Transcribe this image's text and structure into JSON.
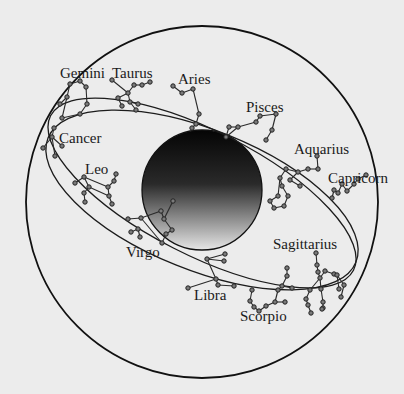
{
  "diagram": {
    "background": "#ececec",
    "outer_circle": {
      "cx": 202,
      "cy": 202,
      "r": 176
    },
    "sun": {
      "cx": 202,
      "cy": 190,
      "r": 60,
      "gradient": [
        "#050505",
        "#2a2a2a",
        "#e6e6e6"
      ]
    },
    "orbits": [
      {
        "cx": 202,
        "cy": 193,
        "rx": 170,
        "ry": 62,
        "rotate": 27
      },
      {
        "cx": 202,
        "cy": 200,
        "rx": 166,
        "ry": 70,
        "rotate": 22
      }
    ],
    "labels": [
      {
        "name": "Gemini",
        "x": 60,
        "y": 78
      },
      {
        "name": "Taurus",
        "x": 112,
        "y": 78
      },
      {
        "name": "Aries",
        "x": 178,
        "y": 84
      },
      {
        "name": "Pisces",
        "x": 246,
        "y": 112
      },
      {
        "name": "Aquarius",
        "x": 294,
        "y": 154
      },
      {
        "name": "Capricorn",
        "x": 328,
        "y": 183
      },
      {
        "name": "Cancer",
        "x": 59,
        "y": 143
      },
      {
        "name": "Leo",
        "x": 85,
        "y": 174
      },
      {
        "name": "Virgo",
        "x": 126,
        "y": 257
      },
      {
        "name": "Sagittarius",
        "x": 273,
        "y": 249
      },
      {
        "name": "Libra",
        "x": 194,
        "y": 300
      },
      {
        "name": "Scorpio",
        "x": 240,
        "y": 321
      }
    ],
    "constellations": [
      {
        "name": "Gemini",
        "stars": [
          [
            80,
            81
          ],
          [
            70,
            84
          ],
          [
            86,
            87
          ],
          [
            67,
            97
          ],
          [
            87,
            104
          ],
          [
            62,
            118
          ],
          [
            80,
            114
          ],
          [
            60,
            104
          ]
        ],
        "lines": [
          [
            0,
            1
          ],
          [
            0,
            2
          ],
          [
            1,
            3
          ],
          [
            3,
            5
          ],
          [
            2,
            4
          ],
          [
            4,
            6
          ],
          [
            5,
            6
          ],
          [
            3,
            7
          ]
        ]
      },
      {
        "name": "Taurus",
        "stars": [
          [
            112,
            80
          ],
          [
            128,
            93
          ],
          [
            134,
            85
          ],
          [
            142,
            85
          ],
          [
            150,
            82
          ],
          [
            118,
            98
          ],
          [
            122,
            106
          ],
          [
            130,
            102
          ],
          [
            136,
            110
          ],
          [
            138,
            104
          ]
        ],
        "lines": [
          [
            0,
            1
          ],
          [
            1,
            2
          ],
          [
            2,
            3
          ],
          [
            3,
            4
          ],
          [
            1,
            5
          ],
          [
            5,
            6
          ],
          [
            1,
            7
          ],
          [
            7,
            8
          ],
          [
            7,
            9
          ]
        ]
      },
      {
        "name": "Aries",
        "stars": [
          [
            173,
            86
          ],
          [
            182,
            93
          ],
          [
            193,
            89
          ],
          [
            199,
            114
          ],
          [
            196,
            124
          ],
          [
            192,
            128
          ]
        ],
        "lines": [
          [
            0,
            1
          ],
          [
            1,
            2
          ],
          [
            2,
            3
          ],
          [
            3,
            4
          ],
          [
            4,
            5
          ]
        ]
      },
      {
        "name": "Pisces",
        "stars": [
          [
            226,
            137
          ],
          [
            229,
            127
          ],
          [
            238,
            127
          ],
          [
            256,
            122
          ],
          [
            260,
            116
          ],
          [
            276,
            114
          ],
          [
            272,
            130
          ],
          [
            266,
            140
          ]
        ],
        "lines": [
          [
            0,
            1
          ],
          [
            1,
            2
          ],
          [
            0,
            2
          ],
          [
            2,
            3
          ],
          [
            3,
            4
          ],
          [
            4,
            5
          ],
          [
            5,
            6
          ],
          [
            6,
            7
          ]
        ]
      },
      {
        "name": "Aquarius",
        "stars": [
          [
            317,
            156
          ],
          [
            318,
            169
          ],
          [
            308,
            169
          ],
          [
            298,
            172
          ],
          [
            286,
            169
          ],
          [
            280,
            178
          ],
          [
            282,
            186
          ],
          [
            290,
            180
          ],
          [
            300,
            186
          ],
          [
            278,
            196
          ],
          [
            270,
            201
          ],
          [
            274,
            208
          ],
          [
            284,
            206
          ],
          [
            288,
            196
          ]
        ],
        "lines": [
          [
            0,
            1
          ],
          [
            1,
            2
          ],
          [
            2,
            3
          ],
          [
            3,
            4
          ],
          [
            4,
            5
          ],
          [
            5,
            6
          ],
          [
            3,
            7
          ],
          [
            7,
            8
          ],
          [
            5,
            9
          ],
          [
            9,
            10
          ],
          [
            10,
            11
          ],
          [
            11,
            12
          ],
          [
            12,
            13
          ],
          [
            13,
            6
          ]
        ]
      },
      {
        "name": "Capricorn",
        "stars": [
          [
            366,
            175
          ],
          [
            358,
            179
          ],
          [
            354,
            184
          ],
          [
            347,
            191
          ],
          [
            342,
            184
          ],
          [
            338,
            193
          ],
          [
            334,
            190
          ],
          [
            332,
            198
          ]
        ],
        "lines": [
          [
            0,
            1
          ],
          [
            1,
            2
          ],
          [
            2,
            3
          ],
          [
            3,
            4
          ],
          [
            4,
            5
          ],
          [
            5,
            6
          ],
          [
            6,
            7
          ]
        ]
      },
      {
        "name": "Cancer",
        "stars": [
          [
            54,
            128
          ],
          [
            52,
            137
          ],
          [
            43,
            148
          ],
          [
            62,
            146
          ],
          [
            55,
            156
          ]
        ],
        "lines": [
          [
            0,
            1
          ],
          [
            1,
            2
          ],
          [
            1,
            3
          ],
          [
            1,
            4
          ]
        ]
      },
      {
        "name": "Leo",
        "stars": [
          [
            75,
            183
          ],
          [
            84,
            177
          ],
          [
            108,
            187
          ],
          [
            114,
            181
          ],
          [
            116,
            174
          ],
          [
            109,
            196
          ],
          [
            112,
            204
          ],
          [
            89,
            187
          ],
          [
            84,
            193
          ],
          [
            85,
            202
          ]
        ],
        "lines": [
          [
            0,
            1
          ],
          [
            1,
            2
          ],
          [
            2,
            3
          ],
          [
            3,
            4
          ],
          [
            2,
            5
          ],
          [
            5,
            6
          ],
          [
            1,
            7
          ],
          [
            7,
            5
          ],
          [
            7,
            8
          ],
          [
            8,
            9
          ]
        ]
      },
      {
        "name": "Virgo",
        "stars": [
          [
            128,
            219
          ],
          [
            141,
            218
          ],
          [
            161,
            211
          ],
          [
            164,
            219
          ],
          [
            173,
            201
          ],
          [
            172,
            230
          ],
          [
            166,
            234
          ],
          [
            162,
            243
          ],
          [
            131,
            232
          ],
          [
            138,
            229
          ],
          [
            140,
            237
          ]
        ],
        "lines": [
          [
            0,
            1
          ],
          [
            1,
            2
          ],
          [
            2,
            3
          ],
          [
            3,
            4
          ],
          [
            3,
            5
          ],
          [
            5,
            6
          ],
          [
            6,
            7
          ],
          [
            1,
            7
          ],
          [
            8,
            9
          ],
          [
            9,
            10
          ]
        ]
      },
      {
        "name": "Libra",
        "stars": [
          [
            207,
            259
          ],
          [
            216,
            279
          ],
          [
            225,
            254
          ],
          [
            224,
            261
          ],
          [
            188,
            288
          ],
          [
            218,
            285
          ],
          [
            234,
            286
          ]
        ],
        "lines": [
          [
            0,
            1
          ],
          [
            0,
            2
          ],
          [
            0,
            3
          ],
          [
            1,
            4
          ],
          [
            1,
            5
          ],
          [
            5,
            6
          ]
        ]
      },
      {
        "name": "Scorpio",
        "stars": [
          [
            252,
            290
          ],
          [
            250,
            301
          ],
          [
            254,
            307
          ],
          [
            259,
            311
          ],
          [
            266,
            306
          ],
          [
            275,
            302
          ],
          [
            278,
            290
          ],
          [
            282,
            286
          ],
          [
            287,
            276
          ],
          [
            292,
            288
          ],
          [
            287,
            268
          ],
          [
            285,
            302
          ]
        ],
        "lines": [
          [
            0,
            1
          ],
          [
            1,
            2
          ],
          [
            2,
            3
          ],
          [
            3,
            4
          ],
          [
            4,
            5
          ],
          [
            5,
            6
          ],
          [
            6,
            7
          ],
          [
            7,
            8
          ],
          [
            7,
            9
          ],
          [
            8,
            10
          ],
          [
            5,
            11
          ]
        ]
      },
      {
        "name": "Sagittarius",
        "stars": [
          [
            316,
            253
          ],
          [
            317,
            265
          ],
          [
            318,
            272
          ],
          [
            320,
            278
          ],
          [
            325,
            271
          ],
          [
            334,
            274
          ],
          [
            337,
            275
          ],
          [
            339,
            289
          ],
          [
            344,
            285
          ],
          [
            341,
            297
          ],
          [
            310,
            290
          ],
          [
            306,
            299
          ],
          [
            308,
            305
          ],
          [
            311,
            313
          ],
          [
            321,
            289
          ],
          [
            323,
            302
          ],
          [
            323,
            308
          ],
          [
            322,
            309
          ]
        ],
        "lines": [
          [
            0,
            1
          ],
          [
            1,
            2
          ],
          [
            2,
            3
          ],
          [
            3,
            4
          ],
          [
            4,
            5
          ],
          [
            5,
            6
          ],
          [
            6,
            7
          ],
          [
            6,
            8
          ],
          [
            8,
            9
          ],
          [
            3,
            10
          ],
          [
            10,
            11
          ],
          [
            11,
            12
          ],
          [
            12,
            13
          ],
          [
            3,
            14
          ],
          [
            14,
            15
          ],
          [
            15,
            16
          ]
        ]
      }
    ]
  }
}
